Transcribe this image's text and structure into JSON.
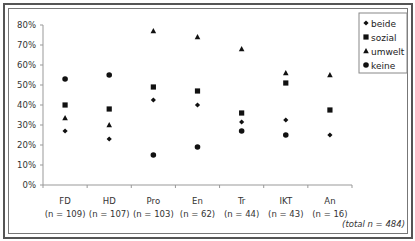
{
  "chart_data": {
    "type": "scatter",
    "title": "",
    "xlabel": "",
    "ylabel": "",
    "ylim": [
      0,
      80
    ],
    "y_ticks": [
      "0%",
      "10%",
      "20%",
      "30%",
      "40%",
      "50%",
      "60%",
      "70%",
      "80%"
    ],
    "y_tick_values": [
      0,
      10,
      20,
      30,
      40,
      50,
      60,
      70,
      80
    ],
    "grid": false,
    "legend_position": "top-right",
    "categories": [
      "FD",
      "HD",
      "Pro",
      "En",
      "Tr",
      "IKT",
      "An"
    ],
    "category_n": [
      "(n = 109)",
      "(n = 107)",
      "(n = 103)",
      "(n = 62)",
      "(n = 44)",
      "(n = 43)",
      "(n = 16)"
    ],
    "series": [
      {
        "name": "beide",
        "marker": "diamond",
        "values": [
          27,
          23,
          42.5,
          40,
          31.5,
          32.5,
          25
        ]
      },
      {
        "name": "sozial",
        "marker": "square",
        "values": [
          40,
          38,
          49,
          47,
          36,
          51,
          37.5
        ]
      },
      {
        "name": "umwelt",
        "marker": "triangle",
        "values": [
          33.5,
          30,
          77,
          74,
          68,
          56,
          55
        ]
      },
      {
        "name": "keine",
        "marker": "circle",
        "values": [
          53,
          55,
          15,
          19,
          27,
          25,
          null
        ]
      }
    ],
    "annotations": [
      "(total n = 484)"
    ]
  },
  "legend": {
    "items": [
      {
        "label": "beide",
        "marker": "diamond"
      },
      {
        "label": "sozial",
        "marker": "square"
      },
      {
        "label": "umwelt",
        "marker": "triangle"
      },
      {
        "label": "keine",
        "marker": "circle"
      }
    ]
  },
  "footnote": "(total n = 484)",
  "colors": {
    "marker": "#111111",
    "axis": "#999999",
    "frame": "#555555"
  }
}
